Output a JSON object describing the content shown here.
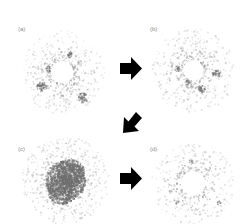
{
  "figure": {
    "panels": [
      {
        "id": "a",
        "label": "(a)",
        "label_x": 18,
        "label_y": 26,
        "cx": 62,
        "cy": 72,
        "hole_r": 11,
        "outer_r": 42,
        "density": 520,
        "core": "ring",
        "blobs": [
          [
            -21,
            14,
            5
          ],
          [
            20,
            25,
            5
          ],
          [
            -14,
            -4,
            3
          ],
          [
            8,
            -18,
            3
          ]
        ]
      },
      {
        "id": "b",
        "label": "(b)",
        "label_x": 150,
        "label_y": 26,
        "cx": 193,
        "cy": 70,
        "hole_r": 10,
        "outer_r": 42,
        "density": 520,
        "core": "ring",
        "blobs": [
          [
            -16,
            -2,
            3
          ],
          [
            23,
            3,
            4
          ],
          [
            8,
            18,
            4
          ],
          [
            -5,
            12,
            3
          ]
        ]
      },
      {
        "id": "c",
        "label": "(c)",
        "label_x": 18,
        "label_y": 146,
        "cx": 65,
        "cy": 180,
        "hole_r": 0,
        "outer_r": 44,
        "density": 700,
        "core": "filled",
        "blobs": [
          [
            0,
            0,
            20
          ],
          [
            5,
            -8,
            14
          ],
          [
            -4,
            10,
            14
          ]
        ]
      },
      {
        "id": "d",
        "label": "(d)",
        "label_x": 150,
        "label_y": 146,
        "cx": 193,
        "cy": 183,
        "hole_r": 12,
        "outer_r": 42,
        "density": 420,
        "core": "ring",
        "blobs": [
          [
            -16,
            19,
            2
          ],
          [
            -3,
            -22,
            2
          ],
          [
            25,
            19,
            2
          ]
        ]
      }
    ],
    "arrows": [
      {
        "id": "a-to-b",
        "direction": "right",
        "x": 120,
        "y": 57,
        "w": 22,
        "h": 23
      },
      {
        "id": "b-to-c",
        "direction": "down-left",
        "x": 123,
        "y": 111,
        "w": 20,
        "h": 22
      },
      {
        "id": "c-to-d",
        "direction": "right",
        "x": 120,
        "y": 167,
        "w": 22,
        "h": 23
      }
    ],
    "colors": {
      "speckle": "#9a9a9a",
      "speckle_dark": "#6e6e6e",
      "arrow": "#000000",
      "label": "#8a8a8a",
      "background": "#ffffff"
    }
  }
}
